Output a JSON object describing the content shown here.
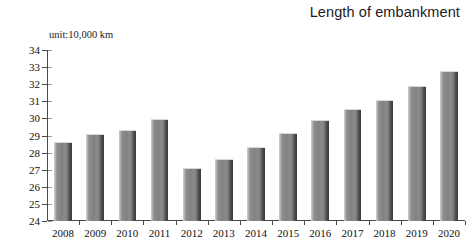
{
  "chart_data": {
    "type": "bar",
    "title": "Length of embankment",
    "unit_label": "unit:10,000 km",
    "xlabel": "",
    "ylabel": "",
    "ylim": [
      24,
      34
    ],
    "ytick_step": 1,
    "grid": false,
    "legend": "none",
    "categories": [
      "2008",
      "2009",
      "2010",
      "2011",
      "2012",
      "2013",
      "2014",
      "2015",
      "2016",
      "2017",
      "2018",
      "2019",
      "2020"
    ],
    "values": [
      28.6,
      29.1,
      29.35,
      29.95,
      27.1,
      27.65,
      28.35,
      29.15,
      29.9,
      30.55,
      31.1,
      31.9,
      32.75
    ],
    "ytick_labels": [
      "34",
      "33",
      "32",
      "31",
      "30",
      "29",
      "28",
      "27",
      "26",
      "25",
      "24"
    ],
    "series": [
      {
        "name": "Length of embankment",
        "values": [
          28.6,
          29.1,
          29.35,
          29.95,
          27.1,
          27.65,
          28.35,
          29.15,
          29.9,
          30.55,
          31.1,
          31.9,
          32.75
        ]
      }
    ],
    "colors": {
      "bar_face": "#828282",
      "bar_highlight": "#cfcfcf",
      "bar_shadow": "#3a3a3a",
      "axis": "#4a4a4a",
      "text": "#111111",
      "background": "#ffffff"
    }
  }
}
